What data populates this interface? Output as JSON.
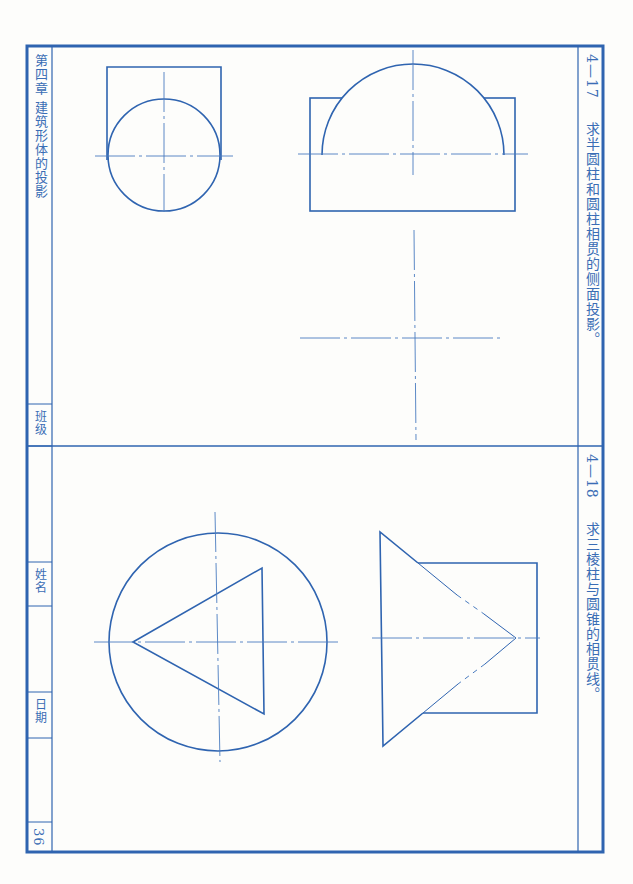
{
  "page": {
    "chapter_title": "第四章 建筑形体的投影",
    "page_number": "36",
    "fields": {
      "class_label": "班级",
      "name_label": "姓名",
      "date_label": "日期"
    }
  },
  "exercises": [
    {
      "number": "4—17",
      "prompt": "求半圆柱和圆柱相贯的侧面投影。"
    },
    {
      "number": "4—18",
      "prompt": "求三棱柱与圆锥的相贯线。"
    }
  ],
  "style": {
    "line_color": "#2f64b0",
    "center_line_color": "#4a7cc0",
    "paper_color": "#fdfdfb"
  }
}
